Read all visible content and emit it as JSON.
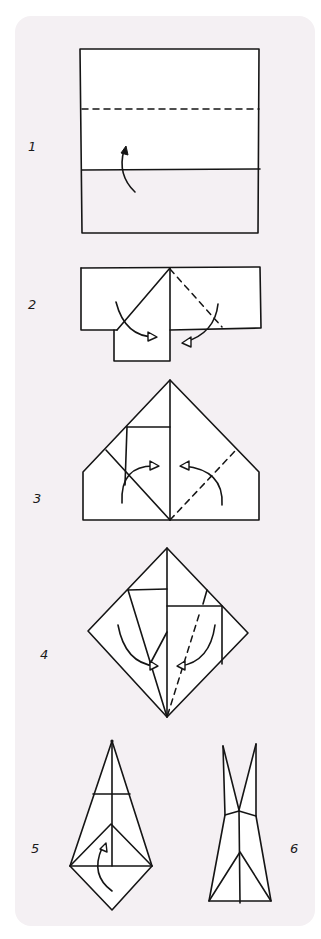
{
  "diagram": {
    "type": "origami-folding-instructions",
    "background_color": "#f4f0f3",
    "paper_color": "#ffffff",
    "ink_color": "#151515",
    "steps": [
      {
        "number": "1",
        "description": "Square with dashed valley-fold line; fold bottom edge up to the dashed line"
      },
      {
        "number": "2",
        "description": "Fold the top corners down to the center line"
      },
      {
        "number": "3",
        "description": "Fold the lower side flaps in toward the center"
      },
      {
        "number": "4",
        "description": "Diamond shape; fold edges to the center crease"
      },
      {
        "number": "5",
        "description": "Kite shape; fold the bottom point up"
      },
      {
        "number": "6",
        "description": "Finished model with two pointed tips"
      }
    ]
  },
  "labels": {
    "step1": "1",
    "step2": "2",
    "step3": "3",
    "step4": "4",
    "step5": "5",
    "step6": "6"
  }
}
